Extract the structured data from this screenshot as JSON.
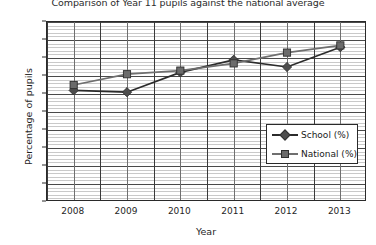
{
  "chart_data": {
    "type": "line",
    "title": "Comparison of Year 11 pupils against the national average",
    "xlabel": "Year",
    "ylabel": "Percentage of pupils",
    "categories": [
      "2008",
      "2009",
      "2010",
      "2011",
      "2012",
      "2013"
    ],
    "series": [
      {
        "name": "School (%)",
        "marker": "diamond",
        "color": "#4d4d4d",
        "values": [
          62,
          61,
          72,
          79,
          75,
          86
        ]
      },
      {
        "name": "National (%)",
        "marker": "square",
        "color": "#6b6b6b",
        "values": [
          65,
          71,
          73,
          77,
          83,
          87
        ]
      }
    ],
    "ylim": [
      0,
      100
    ],
    "ytick_step": 10,
    "yticks": [
      "0",
      "10",
      "20",
      "30",
      "40",
      "50",
      "60",
      "70",
      "80",
      "90",
      "100"
    ],
    "minor_gridline_step": 2,
    "grid": "both",
    "legend_position": "inside-right"
  },
  "legend": {
    "entries": [
      {
        "label": "School (%)"
      },
      {
        "label": "National (%)"
      }
    ]
  }
}
